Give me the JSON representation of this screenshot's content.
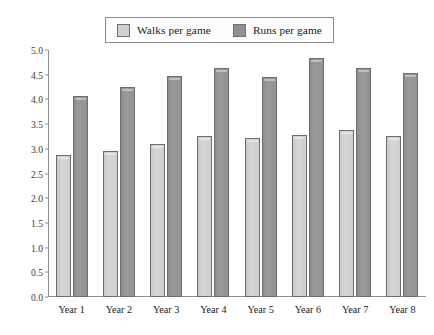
{
  "legend": {
    "position": "top-center",
    "entries": [
      {
        "label": "Walks per game",
        "swatch_name": "legend-swatch-walks",
        "color": "#d0d0d0"
      },
      {
        "label": "Runs per game",
        "swatch_name": "legend-swatch-runs",
        "color": "#929292"
      }
    ]
  },
  "axes": {
    "y_ticks": [
      "0.0",
      "0.5",
      "1.0",
      "1.5",
      "2.0",
      "2.5",
      "3.0",
      "3.5",
      "4.0",
      "4.5",
      "5.0"
    ],
    "x_labels": [
      "Year 1",
      "Year 2",
      "Year 3",
      "Year 4",
      "Year 5",
      "Year 6",
      "Year 7",
      "Year 8"
    ]
  },
  "chart_data": {
    "type": "bar",
    "title": "",
    "subtitle": "",
    "xlabel": "",
    "ylabel": "",
    "categories": [
      "Year 1",
      "Year 2",
      "Year 3",
      "Year 4",
      "Year 5",
      "Year 6",
      "Year 7",
      "Year 8"
    ],
    "series": [
      {
        "name": "Walks per game",
        "color": "#d0d0d0",
        "values": [
          2.88,
          2.95,
          3.1,
          3.25,
          3.22,
          3.27,
          3.38,
          3.25
        ]
      },
      {
        "name": "Runs per game",
        "color": "#929292",
        "values": [
          4.07,
          4.26,
          4.47,
          4.64,
          4.45,
          4.83,
          4.63,
          4.53
        ]
      }
    ],
    "ylim": [
      0.0,
      5.0
    ],
    "ytick_step": 0.5,
    "grid": false,
    "legend_position": "top-center",
    "orientation": "vertical",
    "grouping": "grouped"
  }
}
